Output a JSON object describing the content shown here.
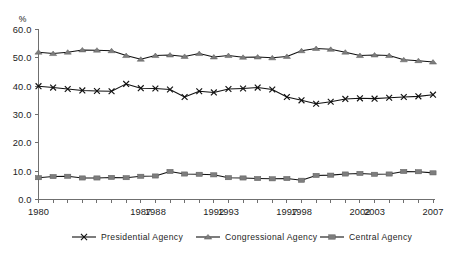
{
  "chart_data": {
    "type": "line",
    "title": "",
    "subtitle": "",
    "xlabel": "",
    "ylabel": "",
    "unit_label": "%",
    "ylim": [
      0.0,
      60.0
    ],
    "ytick_labels": [
      "0.0",
      "10.0",
      "20.0",
      "30.0",
      "40.0",
      "50.0",
      "60.0"
    ],
    "ytick_values": [
      0.0,
      10.0,
      20.0,
      30.0,
      40.0,
      50.0,
      60.0
    ],
    "grid": false,
    "legend_position": "bottom",
    "x": [
      1980,
      1981,
      1982,
      1983,
      1984,
      1985,
      1986,
      1987,
      1988,
      1989,
      1990,
      1991,
      1992,
      1993,
      1994,
      1995,
      1996,
      1997,
      1998,
      1999,
      2000,
      2001,
      2002,
      2003,
      2004,
      2005,
      2006,
      2007
    ],
    "xtick_labels_shown": [
      "1980",
      "1987",
      "1988",
      "1992",
      "1993",
      "1997",
      "1998",
      "2002",
      "2003",
      "2007"
    ],
    "xtick_label_years": [
      1980,
      1987,
      1988,
      1992,
      1993,
      1997,
      1998,
      2002,
      2003,
      2007
    ],
    "series": [
      {
        "name": "Presidential Agency",
        "marker": "x",
        "color": "#111111",
        "values": [
          40.0,
          39.5,
          39.0,
          38.5,
          38.3,
          38.2,
          40.8,
          39.3,
          39.2,
          38.8,
          36.2,
          38.2,
          37.8,
          39.0,
          39.2,
          39.5,
          38.8,
          36.2,
          35.0,
          33.8,
          34.5,
          35.5,
          35.7,
          35.6,
          35.9,
          36.2,
          36.4,
          37.0
        ]
      },
      {
        "name": "Congressional Agency",
        "marker": "triangle",
        "color": "#7d7d7d",
        "values": [
          52.0,
          51.5,
          52.0,
          52.8,
          52.7,
          52.5,
          50.8,
          49.5,
          50.8,
          51.0,
          50.5,
          51.5,
          50.3,
          50.8,
          50.2,
          50.3,
          50.0,
          50.5,
          52.5,
          53.3,
          53.0,
          52.0,
          50.8,
          51.0,
          50.8,
          49.3,
          49.0,
          48.5
        ]
      },
      {
        "name": "Central Agency",
        "marker": "square",
        "color": "#7d7d7d",
        "values": [
          7.7,
          8.1,
          8.2,
          7.6,
          7.6,
          7.8,
          7.7,
          8.2,
          8.3,
          9.9,
          9.0,
          8.9,
          8.7,
          7.7,
          7.6,
          7.4,
          7.3,
          7.4,
          6.8,
          8.5,
          8.6,
          9.0,
          9.2,
          8.9,
          9.0,
          9.9,
          9.8,
          9.4
        ]
      }
    ]
  },
  "legend": {
    "items": [
      {
        "label": "Presidential Agency"
      },
      {
        "label": "Congressional Agency"
      },
      {
        "label": "Central Agency"
      }
    ]
  }
}
